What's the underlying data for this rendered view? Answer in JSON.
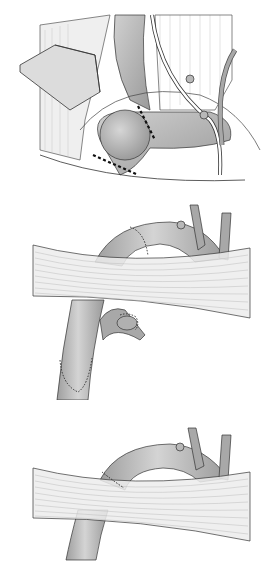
{
  "figure": {
    "type": "surgical-illustration",
    "style": "grayscale line drawing",
    "panels": [
      {
        "id": "top",
        "description": "Retractor and vessels exposed; aneurysmal vessel segment with two dotted resection lines",
        "resection_lines": 2
      },
      {
        "id": "middle",
        "description": "Arch vessel passing over muscle band with sutured anastomoses and sutured branch",
        "sutured_sites": 3
      },
      {
        "id": "bottom",
        "description": "Arch vessel passing over muscle band with single sutured anastomosis",
        "sutured_sites": 1
      }
    ],
    "colors": {
      "background": "#ffffff",
      "vessel_fill": "#a8a8a8",
      "vessel_highlight": "#cfcfcf",
      "outline": "#3a3a3a",
      "muscle_fill": "#ececec",
      "muscle_line": "#b5b5b5",
      "suture": "#222222"
    }
  }
}
